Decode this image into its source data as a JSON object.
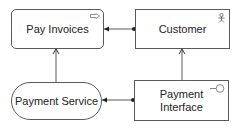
{
  "diagram": {
    "nodes": [
      {
        "id": "pay-invoices",
        "label": "Pay Invoices",
        "icon": "business-process-icon"
      },
      {
        "id": "customer",
        "label": "Customer",
        "icon": "actor-icon"
      },
      {
        "id": "payment-service",
        "label": "Payment Service",
        "icon": "none"
      },
      {
        "id": "payment-interface",
        "label_line1": "Payment",
        "label_line2": "Interface",
        "icon": "interface-icon"
      }
    ],
    "edges": [
      {
        "from": "customer",
        "to": "pay-invoices",
        "style": "assignment"
      },
      {
        "from": "payment-interface",
        "to": "payment-service",
        "style": "assignment"
      },
      {
        "from": "payment-service",
        "to": "pay-invoices",
        "style": "serving"
      },
      {
        "from": "payment-interface",
        "to": "customer",
        "style": "serving"
      }
    ],
    "colors": {
      "line": "#5a5a5a",
      "fill": "#ffffff",
      "text": "#222222"
    }
  }
}
